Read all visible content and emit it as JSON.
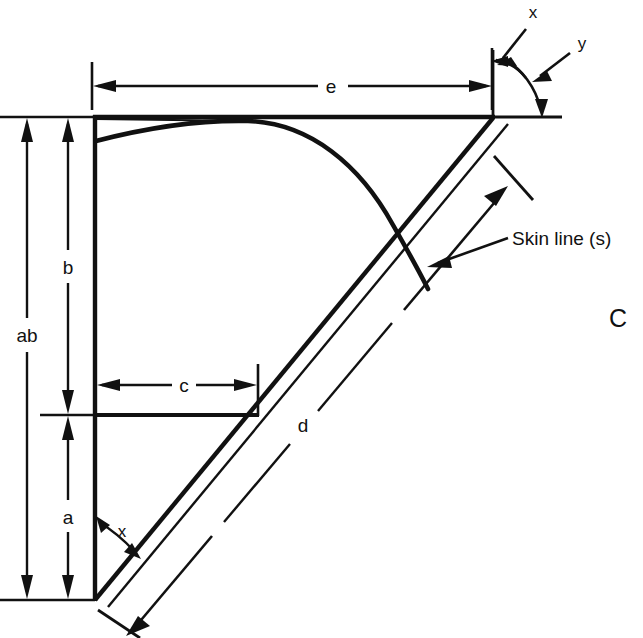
{
  "figure": {
    "label": "C",
    "caption_note": "Skin line (s)",
    "background_color": "#ffffff",
    "ink_color": "#111111"
  },
  "dimensions": [
    {
      "id": "ab",
      "label": "ab",
      "orientation": "vertical",
      "description": "overall height from top line to bottom vertex"
    },
    {
      "id": "b",
      "label": "b",
      "orientation": "vertical",
      "description": "upper height from top line to shelf line"
    },
    {
      "id": "a",
      "label": "a",
      "orientation": "vertical",
      "description": "lower height from shelf line to bottom vertex"
    },
    {
      "id": "c",
      "label": "c",
      "orientation": "horizontal",
      "description": "width of shelf line from vertical line to diagonal"
    },
    {
      "id": "d",
      "label": "d",
      "orientation": "diagonal",
      "description": "length along the inclined member"
    },
    {
      "id": "e",
      "label": "e",
      "orientation": "horizontal",
      "description": "overall width along the top line"
    }
  ],
  "angles": [
    {
      "id": "x-bottom",
      "label": "x",
      "location": "bottom vertex between vertical line and diagonal"
    },
    {
      "id": "x-top",
      "label": "x",
      "location": "top right vertex, upper angle"
    },
    {
      "id": "y-top",
      "label": "y",
      "location": "top right vertex, lower angle to horizontal"
    }
  ],
  "annotations": [
    {
      "id": "skin-line",
      "text": "Skin line (s)",
      "points_to": "curved skin line"
    }
  ]
}
